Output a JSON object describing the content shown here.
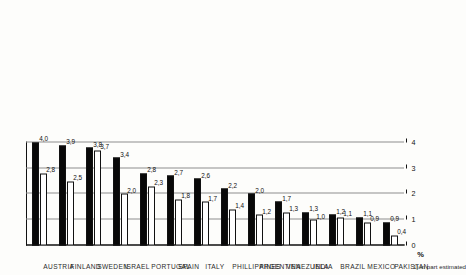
{
  "figure": {
    "value_axis_label": "%",
    "footnote": "1) in part estimated"
  },
  "chart_data": {
    "type": "bar",
    "title": "",
    "xlabel": "",
    "ylabel": "%",
    "ylim": [
      0,
      4
    ],
    "yticks": [
      "0",
      "1",
      "2",
      "3",
      "4"
    ],
    "grid": true,
    "orientation": "vertical-bars-on-rotated-page",
    "legend": [],
    "categories": [
      "AUSTRIA",
      "FINLAND",
      "SWEDEN",
      "ISRAEL",
      "PORTUGAL",
      "SPAIN",
      "ITALY",
      "PHILLIPPINES",
      "ARGENTINA",
      "VENEZUELA",
      "INDIA",
      "BRAZIL",
      "MEXICO",
      "PAKISTAN"
    ],
    "series": [
      {
        "name": "series-dark",
        "color": "#080808",
        "values": [
          4.0,
          3.9,
          3.8,
          3.4,
          2.8,
          2.7,
          2.6,
          2.2,
          2.0,
          1.7,
          1.3,
          1.2,
          1.1,
          0.9
        ],
        "labels": [
          "4,0",
          "3,9",
          "3,8",
          "3,4",
          "2,8",
          "2,7",
          "2,6",
          "2,2",
          "2,0",
          "1,7",
          "1,3",
          "1,2",
          "1,1",
          "0,9"
        ]
      },
      {
        "name": "series-light",
        "color": "#ffffff",
        "values": [
          2.8,
          2.5,
          3.7,
          2.0,
          2.3,
          1.8,
          1.7,
          1.4,
          1.2,
          1.3,
          1.0,
          1.1,
          0.9,
          0.4
        ],
        "labels": [
          "2,8",
          "2,5",
          "3,7",
          "2,0",
          "2,3",
          "1,8",
          "1,7",
          "1,4",
          "1,2",
          "1,3",
          "1,0",
          "1,1",
          "0,9",
          "0,4"
        ]
      }
    ]
  }
}
